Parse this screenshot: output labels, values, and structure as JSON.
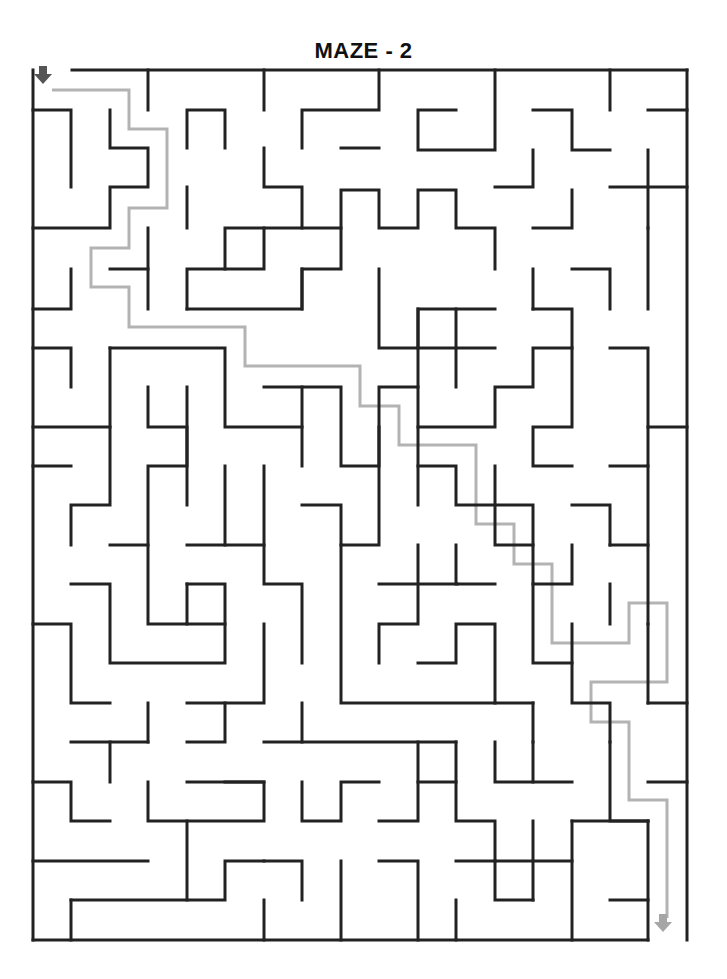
{
  "title": "MAZE - 2",
  "colors": {
    "wall": "#222222",
    "solution": "#b3b3b3",
    "start_arrow": "#555555",
    "end_arrow": "#a6a6a6"
  },
  "maze": {
    "walls": [
      [
        [
          72,
          70
        ],
        [
          687,
          70
        ]
      ],
      [
        [
          33,
          70
        ],
        [
          33,
          940
        ]
      ],
      [
        [
          33,
          940
        ],
        [
          648,
          940
        ]
      ],
      [
        [
          687,
          70
        ],
        [
          687,
          940
        ]
      ],
      [
        [
          148,
          70
        ],
        [
          148,
          110
        ]
      ],
      [
        [
          264,
          70
        ],
        [
          264,
          110
        ]
      ],
      [
        [
          379,
          70
        ],
        [
          379,
          110
        ],
        [
          302,
          110
        ],
        [
          302,
          148
        ]
      ],
      [
        [
          495,
          70
        ],
        [
          495,
          150
        ],
        [
          418,
          150
        ],
        [
          418,
          110
        ],
        [
          456,
          110
        ]
      ],
      [
        [
          610,
          70
        ],
        [
          610,
          110
        ]
      ],
      [
        [
          648,
          110
        ],
        [
          687,
          110
        ]
      ],
      [
        [
          33,
          110
        ],
        [
          71,
          110
        ],
        [
          71,
          187
        ]
      ],
      [
        [
          110,
          110
        ],
        [
          110,
          148
        ],
        [
          148,
          148
        ],
        [
          148,
          187
        ],
        [
          110,
          187
        ],
        [
          110,
          228
        ],
        [
          33,
          228
        ]
      ],
      [
        [
          187,
          148
        ],
        [
          187,
          110
        ],
        [
          225,
          110
        ],
        [
          225,
          148
        ]
      ],
      [
        [
          264,
          148
        ],
        [
          264,
          187
        ],
        [
          302,
          187
        ],
        [
          302,
          228
        ],
        [
          225,
          228
        ],
        [
          225,
          269
        ]
      ],
      [
        [
          341,
          148
        ],
        [
          379,
          148
        ]
      ],
      [
        [
          533,
          110
        ],
        [
          572,
          110
        ],
        [
          572,
          150
        ],
        [
          610,
          150
        ]
      ],
      [
        [
          533,
          150
        ],
        [
          533,
          187
        ],
        [
          495,
          187
        ]
      ],
      [
        [
          148,
          228
        ],
        [
          148,
          309
        ]
      ],
      [
        [
          187,
          187
        ],
        [
          187,
          228
        ]
      ],
      [
        [
          264,
          228
        ],
        [
          264,
          269
        ],
        [
          187,
          269
        ],
        [
          187,
          309
        ]
      ],
      [
        [
          341,
          228
        ],
        [
          341,
          190
        ],
        [
          379,
          190
        ],
        [
          379,
          228
        ],
        [
          418,
          228
        ],
        [
          418,
          190
        ],
        [
          456,
          190
        ],
        [
          456,
          228
        ],
        [
          495,
          228
        ],
        [
          495,
          269
        ]
      ],
      [
        [
          572,
          190
        ],
        [
          572,
          228
        ],
        [
          533,
          228
        ]
      ],
      [
        [
          610,
          187
        ],
        [
          687,
          187
        ]
      ],
      [
        [
          648,
          150
        ],
        [
          648,
          228
        ]
      ],
      [
        [
          572,
          269
        ],
        [
          610,
          269
        ],
        [
          610,
          309
        ]
      ],
      [
        [
          648,
          228
        ],
        [
          648,
          309
        ]
      ],
      [
        [
          71,
          269
        ],
        [
          71,
          309
        ],
        [
          33,
          309
        ]
      ],
      [
        [
          110,
          269
        ],
        [
          148,
          269
        ]
      ],
      [
        [
          187,
          309
        ],
        [
          302,
          309
        ],
        [
          302,
          269
        ],
        [
          341,
          269
        ],
        [
          341,
          228
        ],
        [
          302,
          228
        ]
      ],
      [
        [
          379,
          269
        ],
        [
          379,
          348
        ],
        [
          418,
          348
        ],
        [
          418,
          309
        ],
        [
          495,
          309
        ]
      ],
      [
        [
          302,
          269
        ],
        [
          302,
          309
        ]
      ],
      [
        [
          33,
          348
        ],
        [
          71,
          348
        ],
        [
          71,
          387
        ]
      ],
      [
        [
          110,
          348
        ],
        [
          225,
          348
        ],
        [
          225,
          427
        ],
        [
          302,
          427
        ]
      ],
      [
        [
          110,
          348
        ],
        [
          110,
          505
        ],
        [
          71,
          505
        ],
        [
          71,
          545
        ]
      ],
      [
        [
          33,
          427
        ],
        [
          110,
          427
        ]
      ],
      [
        [
          33,
          466
        ],
        [
          71,
          466
        ]
      ],
      [
        [
          148,
          387
        ],
        [
          148,
          427
        ],
        [
          187,
          427
        ],
        [
          187,
          505
        ]
      ],
      [
        [
          187,
          387
        ],
        [
          187,
          466
        ],
        [
          148,
          466
        ],
        [
          148,
          624
        ],
        [
          187,
          624
        ],
        [
          187,
          584
        ]
      ],
      [
        [
          264,
          387
        ],
        [
          341,
          387
        ],
        [
          341,
          466
        ],
        [
          379,
          466
        ],
        [
          379,
          387
        ],
        [
          418,
          387
        ],
        [
          418,
          427
        ],
        [
          495,
          427
        ],
        [
          495,
          387
        ],
        [
          533,
          387
        ],
        [
          533,
          348
        ],
        [
          572,
          348
        ],
        [
          572,
          309
        ],
        [
          533,
          309
        ]
      ],
      [
        [
          418,
          309
        ],
        [
          418,
          387
        ]
      ],
      [
        [
          456,
          309
        ],
        [
          456,
          387
        ]
      ],
      [
        [
          418,
          348
        ],
        [
          495,
          348
        ]
      ],
      [
        [
          302,
          387
        ],
        [
          302,
          466
        ]
      ],
      [
        [
          533,
          269
        ],
        [
          533,
          309
        ]
      ],
      [
        [
          572,
          348
        ],
        [
          572,
          427
        ],
        [
          533,
          427
        ],
        [
          533,
          466
        ],
        [
          572,
          466
        ]
      ],
      [
        [
          610,
          348
        ],
        [
          648,
          348
        ],
        [
          648,
          427
        ],
        [
          687,
          427
        ]
      ],
      [
        [
          648,
          427
        ],
        [
          648,
          466
        ],
        [
          610,
          466
        ]
      ],
      [
        [
          225,
          466
        ],
        [
          225,
          545
        ]
      ],
      [
        [
          264,
          466
        ],
        [
          264,
          584
        ],
        [
          302,
          584
        ],
        [
          302,
          663
        ]
      ],
      [
        [
          302,
          505
        ],
        [
          341,
          505
        ],
        [
          341,
          545
        ],
        [
          379,
          545
        ],
        [
          379,
          427
        ]
      ],
      [
        [
          187,
          545
        ],
        [
          264,
          545
        ]
      ],
      [
        [
          110,
          545
        ],
        [
          148,
          545
        ]
      ],
      [
        [
          71,
          584
        ],
        [
          110,
          584
        ],
        [
          110,
          663
        ],
        [
          225,
          663
        ],
        [
          225,
          584
        ],
        [
          187,
          584
        ]
      ],
      [
        [
          187,
          624
        ],
        [
          225,
          624
        ]
      ],
      [
        [
          418,
          466
        ],
        [
          456,
          466
        ],
        [
          456,
          505
        ],
        [
          533,
          505
        ],
        [
          533,
          545
        ]
      ],
      [
        [
          418,
          427
        ],
        [
          418,
          505
        ]
      ],
      [
        [
          456,
          545
        ],
        [
          456,
          584
        ],
        [
          495,
          584
        ]
      ],
      [
        [
          495,
          466
        ],
        [
          495,
          545
        ],
        [
          533,
          545
        ],
        [
          533,
          584
        ],
        [
          572,
          584
        ],
        [
          572,
          545
        ]
      ],
      [
        [
          572,
          505
        ],
        [
          610,
          505
        ],
        [
          610,
          545
        ]
      ],
      [
        [
          610,
          545
        ],
        [
          648,
          545
        ]
      ],
      [
        [
          648,
          466
        ],
        [
          648,
          624
        ]
      ],
      [
        [
          379,
          584
        ],
        [
          457,
          584
        ]
      ],
      [
        [
          418,
          545
        ],
        [
          418,
          624
        ],
        [
          379,
          624
        ],
        [
          379,
          663
        ]
      ],
      [
        [
          341,
          545
        ],
        [
          341,
          703
        ],
        [
          533,
          703
        ]
      ],
      [
        [
          418,
          663
        ],
        [
          456,
          663
        ],
        [
          456,
          624
        ],
        [
          495,
          624
        ],
        [
          495,
          703
        ]
      ],
      [
        [
          533,
          584
        ],
        [
          533,
          663
        ],
        [
          572,
          663
        ]
      ],
      [
        [
          572,
          624
        ],
        [
          572,
          703
        ],
        [
          610,
          703
        ],
        [
          610,
          742
        ]
      ],
      [
        [
          610,
          584
        ],
        [
          610,
          624
        ]
      ],
      [
        [
          648,
          624
        ],
        [
          648,
          703
        ]
      ],
      [
        [
          33,
          624
        ],
        [
          71,
          624
        ],
        [
          71,
          703
        ],
        [
          110,
          703
        ]
      ],
      [
        [
          148,
          703
        ],
        [
          148,
          742
        ]
      ],
      [
        [
          187,
          703
        ],
        [
          264,
          703
        ],
        [
          264,
          624
        ]
      ],
      [
        [
          71,
          742
        ],
        [
          148,
          742
        ]
      ],
      [
        [
          110,
          742
        ],
        [
          110,
          782
        ]
      ],
      [
        [
          33,
          782
        ],
        [
          71,
          782
        ],
        [
          71,
          821
        ],
        [
          110,
          821
        ]
      ],
      [
        [
          148,
          782
        ],
        [
          148,
          821
        ],
        [
          264,
          821
        ],
        [
          264,
          782
        ],
        [
          187,
          782
        ]
      ],
      [
        [
          187,
          821
        ],
        [
          187,
          900
        ]
      ],
      [
        [
          33,
          861
        ],
        [
          148,
          861
        ]
      ],
      [
        [
          71,
          900
        ],
        [
          71,
          940
        ]
      ],
      [
        [
          71,
          900
        ],
        [
          225,
          900
        ],
        [
          225,
          861
        ],
        [
          264,
          861
        ]
      ],
      [
        [
          187,
          742
        ],
        [
          225,
          742
        ],
        [
          225,
          703
        ]
      ],
      [
        [
          264,
          742
        ],
        [
          456,
          742
        ]
      ],
      [
        [
          302,
          703
        ],
        [
          302,
          742
        ]
      ],
      [
        [
          225,
          782
        ],
        [
          264,
          782
        ]
      ],
      [
        [
          302,
          782
        ],
        [
          302,
          821
        ],
        [
          341,
          821
        ],
        [
          341,
          782
        ],
        [
          379,
          782
        ]
      ],
      [
        [
          264,
          861
        ],
        [
          302,
          861
        ],
        [
          302,
          900
        ]
      ],
      [
        [
          264,
          900
        ],
        [
          264,
          940
        ]
      ],
      [
        [
          341,
          861
        ],
        [
          341,
          940
        ]
      ],
      [
        [
          379,
          821
        ],
        [
          418,
          821
        ],
        [
          418,
          742
        ]
      ],
      [
        [
          379,
          861
        ],
        [
          418,
          861
        ],
        [
          418,
          940
        ]
      ],
      [
        [
          456,
          742
        ],
        [
          456,
          821
        ],
        [
          495,
          821
        ],
        [
          495,
          900
        ],
        [
          533,
          900
        ]
      ],
      [
        [
          418,
          782
        ],
        [
          456,
          782
        ]
      ],
      [
        [
          456,
          861
        ],
        [
          495,
          861
        ]
      ],
      [
        [
          456,
          900
        ],
        [
          456,
          940
        ]
      ],
      [
        [
          495,
          742
        ],
        [
          495,
          782
        ],
        [
          572,
          782
        ]
      ],
      [
        [
          533,
          742
        ],
        [
          533,
          782
        ]
      ],
      [
        [
          533,
          703
        ],
        [
          533,
          742
        ]
      ],
      [
        [
          610,
          742
        ],
        [
          610,
          821
        ],
        [
          648,
          821
        ]
      ],
      [
        [
          572,
          821
        ],
        [
          648,
          821
        ]
      ],
      [
        [
          533,
          821
        ],
        [
          533,
          900
        ]
      ],
      [
        [
          495,
          861
        ],
        [
          572,
          861
        ]
      ],
      [
        [
          572,
          821
        ],
        [
          572,
          940
        ]
      ],
      [
        [
          648,
          821
        ],
        [
          648,
          940
        ]
      ],
      [
        [
          610,
          900
        ],
        [
          648,
          900
        ]
      ],
      [
        [
          648,
          782
        ],
        [
          687,
          782
        ]
      ],
      [
        [
          648,
          703
        ],
        [
          687,
          703
        ]
      ]
    ],
    "solution_path": [
      [
        52,
        90
      ],
      [
        129,
        90
      ],
      [
        129,
        129
      ],
      [
        167,
        129
      ],
      [
        167,
        208
      ],
      [
        129,
        208
      ],
      [
        129,
        248
      ],
      [
        91,
        248
      ],
      [
        91,
        287
      ],
      [
        129,
        287
      ],
      [
        129,
        327
      ],
      [
        245,
        327
      ],
      [
        245,
        366
      ],
      [
        360,
        366
      ],
      [
        360,
        406
      ],
      [
        399,
        406
      ],
      [
        399,
        445
      ],
      [
        476,
        445
      ],
      [
        476,
        524
      ],
      [
        514,
        524
      ],
      [
        514,
        564
      ],
      [
        552,
        564
      ],
      [
        552,
        643
      ],
      [
        629,
        643
      ],
      [
        629,
        603
      ],
      [
        667,
        603
      ],
      [
        667,
        682
      ],
      [
        591,
        682
      ],
      [
        591,
        722
      ],
      [
        629,
        722
      ],
      [
        629,
        800
      ],
      [
        667,
        800
      ],
      [
        667,
        918
      ]
    ],
    "start_arrow": {
      "x": 43,
      "y": 68,
      "direction": "down"
    },
    "end_arrow": {
      "x": 663,
      "y": 916,
      "direction": "down"
    }
  }
}
